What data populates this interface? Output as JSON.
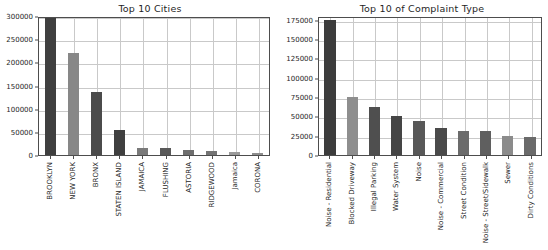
{
  "figure": {
    "width": 548,
    "height": 250,
    "background": "#ffffff"
  },
  "chart_data": [
    {
      "type": "bar",
      "title": "Top 10 Cities",
      "xlabel": "",
      "ylabel": "",
      "grid": true,
      "legend": "none",
      "ylim": [
        0,
        300000
      ],
      "yticks": [
        0,
        50000,
        100000,
        150000,
        200000,
        250000,
        300000
      ],
      "ytick_labels": [
        "0",
        "50000",
        "100000",
        "150000",
        "200000",
        "250000",
        "300000"
      ],
      "categories": [
        "BROOKLYN",
        "NEW YORK",
        "BRONX",
        "STATEN ISLAND",
        "JAMAICA",
        "FLUSHING",
        "ASTORIA",
        "RIDGEWOOD",
        "Jamaica",
        "CORONA"
      ],
      "values": [
        295000,
        221000,
        137000,
        54000,
        16000,
        15000,
        11000,
        9000,
        6000,
        5000
      ],
      "bar_colors": [
        "#3f3f3f",
        "#878787",
        "#4b4b4b",
        "#3f3f3f",
        "#7a7a7a",
        "#595959",
        "#6e6e6e",
        "#747474",
        "#9a9a9a",
        "#8d8d8d"
      ]
    },
    {
      "type": "bar",
      "title": "Top 10 of Complaint Type",
      "xlabel": "",
      "ylabel": "",
      "grid": true,
      "legend": "none",
      "ylim": [
        0,
        180000
      ],
      "yticks": [
        0,
        25000,
        50000,
        75000,
        100000,
        125000,
        150000,
        175000
      ],
      "ytick_labels": [
        "0",
        "25000",
        "50000",
        "75000",
        "100000",
        "125000",
        "150000",
        "175000"
      ],
      "categories": [
        "Noise - Residential",
        "Blocked Driveway",
        "Illegal Parking",
        "Water System",
        "Noise",
        "Noise - Commercial",
        "Street Condition",
        "Noise - Street/Sidewalk",
        "Sewer",
        "Dirty Conditions"
      ],
      "values": [
        174500,
        75500,
        62000,
        50500,
        43500,
        34500,
        31500,
        31500,
        25000,
        23000
      ],
      "bar_colors": [
        "#3c3c3c",
        "#8e8e8e",
        "#4f4f4f",
        "#454545",
        "#585858",
        "#4a4a4a",
        "#6b6b6b",
        "#5f5f5f",
        "#8b8b8b",
        "#6a6a6a"
      ]
    }
  ]
}
